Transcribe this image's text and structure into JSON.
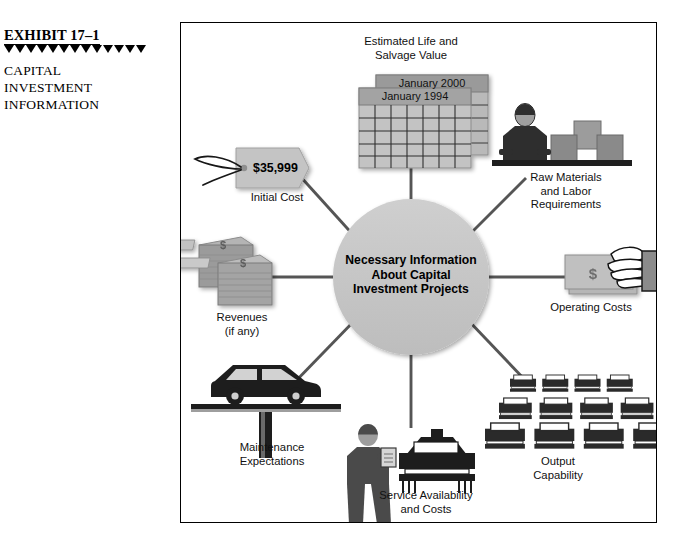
{
  "caption": {
    "exhibit_number": "EXHIBIT 17–1",
    "title_lines": [
      "CAPITAL",
      "INVESTMENT",
      "INFORMATION"
    ]
  },
  "figure": {
    "hub": {
      "lines": [
        "Necessary Information",
        "About Capital",
        "Investment Projects"
      ],
      "fill": "#c6c6c6"
    },
    "nodes": [
      {
        "id": "estimated-life",
        "icon": "calendar-icon",
        "label_lines": [
          "Estimated Life and",
          "Salvage Value"
        ],
        "calendar_back": "January 2000",
        "calendar_front": "January 1994"
      },
      {
        "id": "initial-cost",
        "icon": "price-tag-icon",
        "label_lines": [
          "Initial Cost"
        ],
        "amount": "$35,999"
      },
      {
        "id": "raw-materials",
        "icon": "worker-boxes-icon",
        "label_lines": [
          "Raw Materials",
          "and Labor",
          "Requirements"
        ]
      },
      {
        "id": "revenues",
        "icon": "money-stacks-icon",
        "label_lines": [
          "Revenues",
          "(if any)"
        ],
        "currency_symbol": "$"
      },
      {
        "id": "operating-costs",
        "icon": "hand-cash-icon",
        "label_lines": [
          "Operating Costs"
        ],
        "currency_symbol": "$"
      },
      {
        "id": "maintenance",
        "icon": "car-on-lift-icon",
        "label_lines": [
          "Maintenance",
          "Expectations"
        ]
      },
      {
        "id": "service-availability",
        "icon": "mechanic-car-icon",
        "label_lines": [
          "Service Availability",
          "and Costs"
        ]
      },
      {
        "id": "output-capability",
        "icon": "car-fleet-icon",
        "label_lines": [
          "Output",
          "Capability"
        ]
      }
    ],
    "colors": {
      "spoke": "#555555",
      "hub_fill": "#c6c6c6",
      "icon_gray": "#9a9a9a",
      "icon_dark": "#3b3b3b",
      "frame_border": "#000000"
    }
  }
}
